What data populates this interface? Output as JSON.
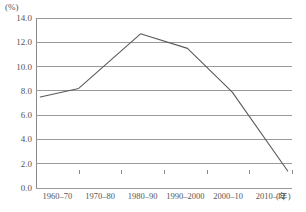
{
  "chart_data": {
    "type": "line",
    "title": "",
    "subtitle": "",
    "xlabel": "年",
    "ylabel": "(%)",
    "unit_label": "(%)",
    "x_axis_unit": "(年)",
    "categories": [
      "1960–70",
      "1970–80",
      "1980–90",
      "1990–2000",
      "2000–10",
      "2010–12"
    ],
    "values": [
      7.5,
      8.2,
      12.7,
      11.5,
      7.9,
      1.4
    ],
    "series": [
      {
        "name": "",
        "values": [
          7.5,
          8.2,
          12.7,
          11.5,
          7.9,
          1.4
        ]
      }
    ],
    "ylim": [
      0.0,
      14.0
    ],
    "ytick_values": [
      0.0,
      2.0,
      4.0,
      6.0,
      8.0,
      10.0,
      12.0,
      14.0
    ],
    "ytick_labels": [
      "0.0",
      "2.0",
      "4.0",
      "6.0",
      "8.0",
      "10.0",
      "12.0",
      "14.0"
    ],
    "grid": true,
    "grid_axis": "y",
    "legend": false,
    "legend_position": "none",
    "line_color": "#5a5a5a",
    "grid_color": "#9a9a9a",
    "background_color": "#ffffff",
    "markers": false,
    "annotations": []
  }
}
